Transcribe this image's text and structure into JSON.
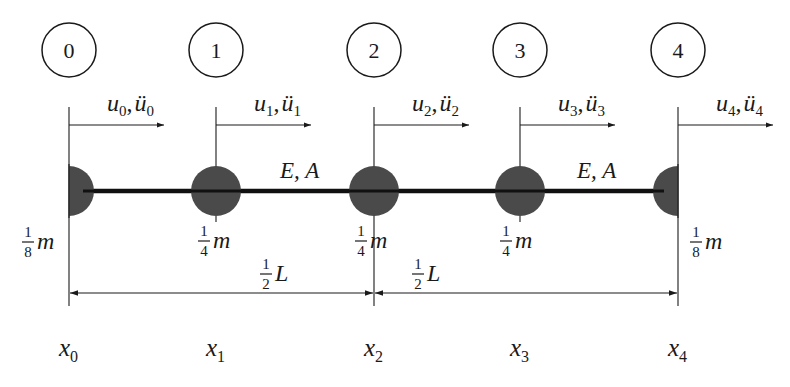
{
  "diagram": {
    "colors": {
      "ink": "#1a1a1a",
      "mass": "#4a4a4a",
      "bar": "#111111",
      "background": "#ffffff"
    },
    "nodes": [
      {
        "id": "0",
        "disp": "u",
        "sub": "0",
        "accel": "ü",
        "mass_num": "1",
        "mass_den": "8",
        "mass_sym": "m",
        "coord": "x",
        "coord_sub": "0",
        "half": "right"
      },
      {
        "id": "1",
        "disp": "u",
        "sub": "1",
        "accel": "ü",
        "mass_num": "1",
        "mass_den": "4",
        "mass_sym": "m",
        "coord": "x",
        "coord_sub": "1",
        "half": "full"
      },
      {
        "id": "2",
        "disp": "u",
        "sub": "2",
        "accel": "ü",
        "mass_num": "1",
        "mass_den": "4",
        "mass_sym": "m",
        "coord": "x",
        "coord_sub": "2",
        "half": "full"
      },
      {
        "id": "3",
        "disp": "u",
        "sub": "3",
        "accel": "ü",
        "mass_num": "1",
        "mass_den": "4",
        "mass_sym": "m",
        "coord": "x",
        "coord_sub": "3",
        "half": "full"
      },
      {
        "id": "4",
        "disp": "u",
        "sub": "4",
        "accel": "ü",
        "mass_num": "1",
        "mass_den": "8",
        "mass_sym": "m",
        "coord": "x",
        "coord_sub": "4",
        "half": "left"
      }
    ],
    "element_labels": [
      {
        "text": "E, A"
      },
      {
        "text": "E, A"
      }
    ],
    "dimensions": [
      {
        "num": "1",
        "den": "2",
        "sym": "L"
      },
      {
        "num": "1",
        "den": "2",
        "sym": "L"
      }
    ]
  }
}
